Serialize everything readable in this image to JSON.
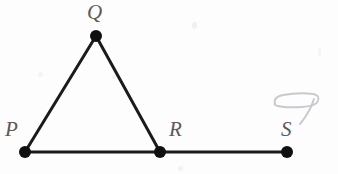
{
  "figure": {
    "background_color": "#fdfdfd",
    "stroke_color": "#1b1b1b",
    "label_color": "#5a5a5a",
    "scribble_color": "#c9c9cf",
    "stroke_width": 3,
    "vertex_radius": 6,
    "points": [
      {
        "id": "P",
        "label": "P",
        "x": 25,
        "y": 152,
        "label_x": 5,
        "label_y": 119
      },
      {
        "id": "Q",
        "label": "Q",
        "x": 96,
        "y": 36,
        "label_x": 87,
        "label_y": 2
      },
      {
        "id": "R",
        "label": "R",
        "x": 160,
        "y": 152,
        "label_x": 169,
        "label_y": 119
      },
      {
        "id": "S",
        "label": "S",
        "x": 287,
        "y": 152,
        "label_x": 281,
        "label_y": 119
      }
    ],
    "segments": [
      {
        "id": "PQ",
        "from": "P",
        "to": "Q",
        "x1": 25,
        "y1": 152,
        "x2": 96,
        "y2": 36
      },
      {
        "id": "QR",
        "from": "Q",
        "to": "R",
        "x1": 96,
        "y1": 36,
        "x2": 160,
        "y2": 152
      },
      {
        "id": "PR",
        "from": "P",
        "to": "R",
        "x1": 25,
        "y1": 152,
        "x2": 160,
        "y2": 152
      },
      {
        "id": "RS",
        "from": "R",
        "to": "S",
        "x1": 160,
        "y1": 152,
        "x2": 287,
        "y2": 152
      }
    ],
    "annotation": {
      "id": "pencil-scribble",
      "note": "faint light-gray handwritten loop with a descending tail, above and right of label S"
    }
  }
}
